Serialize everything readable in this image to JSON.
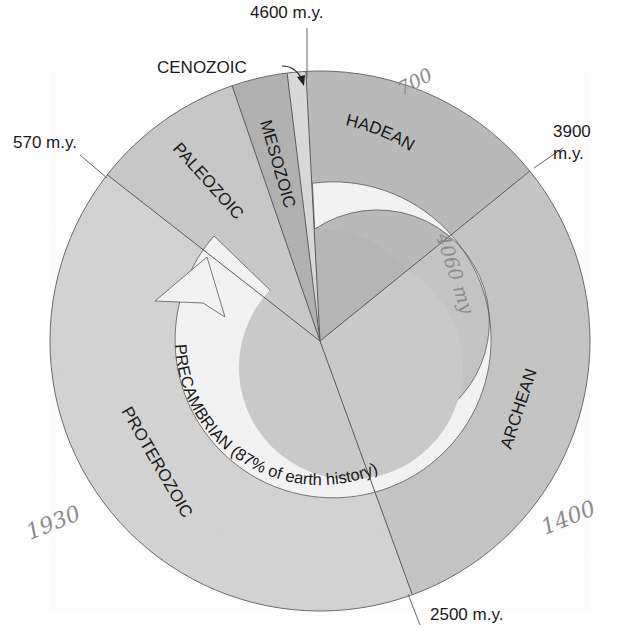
{
  "diagram": {
    "center": {
      "x": 320,
      "y": 341
    },
    "outer_radius": 270,
    "colors": {
      "hadean": "#b9b9b9",
      "archean": "#c4c4c4",
      "proterozoic": "#d3d3d3",
      "paleozoic": "#c7c7c7",
      "mesozoic": "#b0b0b0",
      "cenozoic": "#d9d9d9",
      "inner_disk_top": "#b5b5b5",
      "inner_disk_bottom": "#cacaca",
      "ring": "#f4f4f4",
      "line": "#555555",
      "text": "#1a1a1a",
      "pencil": "#8c8c8c"
    },
    "eons": [
      {
        "name": "HADEAN",
        "label": "HADEAN"
      },
      {
        "name": "ARCHEAN",
        "label": "ARCHEAN"
      },
      {
        "name": "PROTEROZOIC",
        "label": "PROTEROZOIC"
      }
    ],
    "eras": [
      {
        "name": "PALEOZOIC",
        "label": "PALEOZOIC"
      },
      {
        "name": "MESOZOIC",
        "label": "MESOZOIC"
      },
      {
        "name": "CENOZOIC",
        "label": "CENOZOIC"
      }
    ],
    "boundaries": {
      "b4600": "4600 m.y.",
      "b3900_line1": "3900",
      "b3900_line2": "m.y.",
      "b2500": "2500 m.y.",
      "b570": "570 m.y."
    },
    "ring_label": "PRECAMBRIAN (87% of earth history)",
    "handwritten_notes": {
      "top_right": "700",
      "ring_right": "4060 my",
      "bottom_right": "1400",
      "bottom_left": "1930"
    }
  }
}
